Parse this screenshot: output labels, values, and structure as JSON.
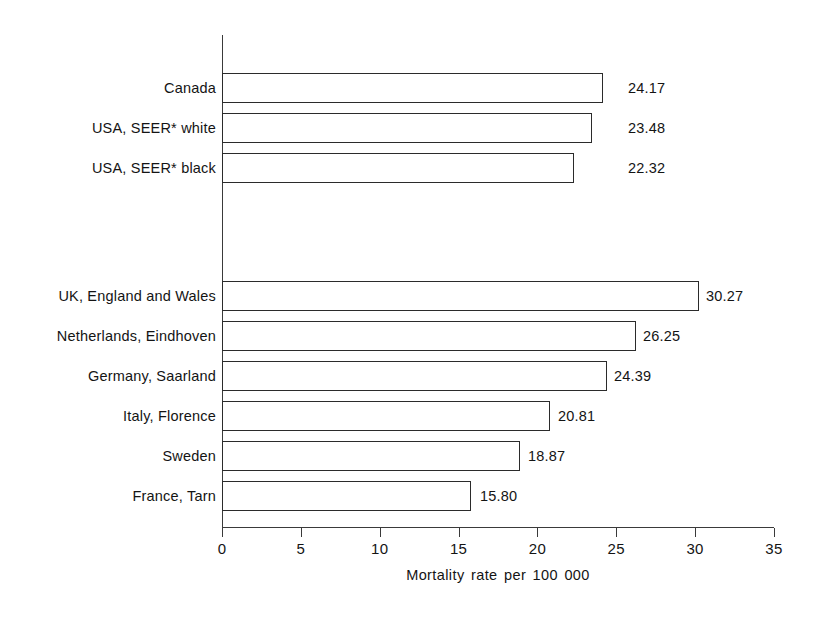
{
  "chart_data": {
    "type": "bar",
    "orientation": "horizontal",
    "title": "",
    "xlabel": "Mortality rate per 100 000",
    "ylabel": "",
    "xlim": [
      0,
      35
    ],
    "xticks": [
      "0",
      "5",
      "10",
      "15",
      "20",
      "25",
      "30",
      "35"
    ],
    "grid": false,
    "legend": "none",
    "categories": [
      "Canada",
      "USA, SEER* white",
      "USA, SEER* black",
      "UK, England and Wales",
      "Netherlands, Eindhoven",
      "Germany, Saarland",
      "Italy, Florence",
      "Sweden",
      "France, Tarn"
    ],
    "values": [
      24.17,
      23.48,
      22.32,
      30.27,
      26.25,
      24.39,
      20.81,
      18.87,
      15.8
    ],
    "value_labels": [
      "24.17",
      "23.48",
      "22.32",
      "30.27",
      "26.25",
      "24.39",
      "20.81",
      "18.87",
      "15.80"
    ],
    "groups": [
      {
        "name": "north-america",
        "categories": [
          "Canada",
          "USA, SEER* white",
          "USA, SEER* black"
        ]
      },
      {
        "name": "europe",
        "categories": [
          "UK, England and Wales",
          "Netherlands, Eindhoven",
          "Germany, Saarland",
          "Italy, Florence",
          "Sweden",
          "France, Tarn"
        ]
      }
    ],
    "bar_face_color": "#ffffff",
    "bar_edge_color": "#2b2b2b",
    "axis_color": "#3a3a3a",
    "text_color": "#141414",
    "background_color": "#ffffff"
  },
  "bars": [
    {
      "label": "Canada",
      "value": 24.17,
      "value_text": "24.17",
      "top": 73,
      "label_right": 216,
      "value_left": 628
    },
    {
      "label": "USA, SEER* white",
      "value": 23.48,
      "value_text": "23.48",
      "top": 113,
      "label_right": 216,
      "value_left": 628
    },
    {
      "label": "USA, SEER* black",
      "value": 22.32,
      "value_text": "22.32",
      "top": 153,
      "label_right": 216,
      "value_left": 628
    },
    {
      "label": "UK, England and Wales",
      "value": 30.27,
      "value_text": "30.27",
      "top": 281,
      "label_right": 216,
      "value_left": 706
    },
    {
      "label": "Netherlands, Eindhoven",
      "value": 26.25,
      "value_text": "26.25",
      "top": 321,
      "label_right": 216,
      "value_left": 643
    },
    {
      "label": "Germany, Saarland",
      "value": 24.39,
      "value_text": "24.39",
      "top": 361,
      "label_right": 216,
      "value_left": 614
    },
    {
      "label": "Italy, Florence",
      "value": 20.81,
      "value_text": "20.81",
      "top": 401,
      "label_right": 216,
      "value_left": 558
    },
    {
      "label": "Sweden",
      "value": 18.87,
      "value_text": "18.87",
      "top": 441,
      "label_right": 216,
      "value_left": 528
    },
    {
      "label": "France, Tarn",
      "value": 15.8,
      "value_text": "15.80",
      "top": 481,
      "label_right": 216,
      "value_left": 480
    }
  ],
  "xaxis": {
    "title": "Mortality rate per 100 000",
    "ticks": [
      {
        "label": "0",
        "value": 0
      },
      {
        "label": "5",
        "value": 5
      },
      {
        "label": "10",
        "value": 10
      },
      {
        "label": "15",
        "value": 15
      },
      {
        "label": "20",
        "value": 20
      },
      {
        "label": "25",
        "value": 25
      },
      {
        "label": "30",
        "value": 30
      },
      {
        "label": "35",
        "value": 35
      }
    ]
  },
  "geometry": {
    "origin_x": 222,
    "axis_top": 35,
    "baseline_y": 527,
    "px_per_unit": 15.771,
    "bar_height": 30
  }
}
